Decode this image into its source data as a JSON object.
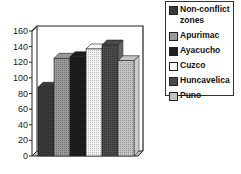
{
  "chart_data": {
    "type": "bar",
    "style": "3d-clustered",
    "title": "",
    "xlabel": "",
    "ylabel": "",
    "ylim": [
      0,
      160
    ],
    "yticks": [
      0,
      20,
      40,
      60,
      80,
      100,
      120,
      140,
      160
    ],
    "grid": false,
    "legend_position": "right-top",
    "categories": [
      ""
    ],
    "series": [
      {
        "name": "Non-conflict zones",
        "values": [
          88
        ],
        "color": "#3a3a3a"
      },
      {
        "name": "Apurimac",
        "values": [
          125
        ],
        "color": "#9a9a9a"
      },
      {
        "name": "Ayacucho",
        "values": [
          127
        ],
        "color": "#1e1e1e"
      },
      {
        "name": "Cuzco",
        "values": [
          137
        ],
        "color": "#f4f4f4"
      },
      {
        "name": "Huncavelica",
        "values": [
          142
        ],
        "color": "#4a4a4a"
      },
      {
        "name": "Puno",
        "values": [
          122
        ],
        "color": "#c4c4c4"
      }
    ]
  },
  "legend": {
    "items": [
      {
        "label": "Non-conflict",
        "label2": "zones"
      },
      {
        "label": "Apurimac"
      },
      {
        "label": "Ayacucho"
      },
      {
        "label": "Cuzco"
      },
      {
        "label": "Huncavelica"
      },
      {
        "label": "Puno"
      }
    ]
  }
}
